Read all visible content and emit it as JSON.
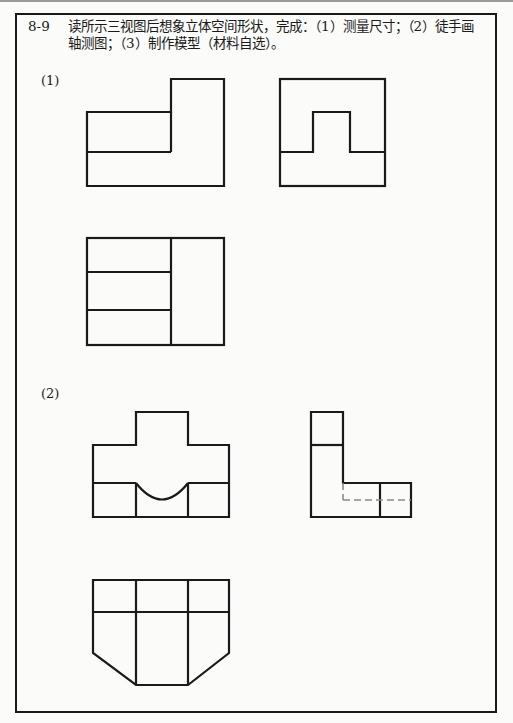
{
  "exercise": {
    "number": "8-9",
    "instruction_line1": "读所示三视图后想象立体空间形状，完成：（1）测量尺寸；（2）徒手画",
    "instruction_line2": "轴测图；（3）制作模型（材料自选）。"
  },
  "problems": [
    {
      "label": "(1)",
      "views": [
        "front-view",
        "side-view",
        "top-view"
      ]
    },
    {
      "label": "(2)",
      "views": [
        "front-view",
        "side-view",
        "top-view"
      ]
    }
  ],
  "colors": {
    "line": "#1a1a1a",
    "hidden_line": "#8a8a8a",
    "paper": "#fbfbf9"
  }
}
